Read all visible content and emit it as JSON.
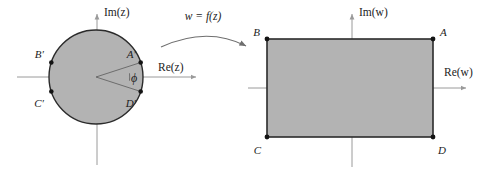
{
  "figure": {
    "background_color": "#ffffff",
    "ink_color": "#1c1c1c",
    "fill_color": "#b3b3b3",
    "axis_color": "#9a9a9a",
    "outline_color": "#2b2b2b"
  },
  "mapping": {
    "label": "w = f(z)",
    "arrow_name": "curved-arrow"
  },
  "z_plane": {
    "axis_imaginary_label": "Im(z)",
    "axis_real_label": "Re(z)",
    "shape": "circle",
    "center": [
      96,
      77
    ],
    "radius": 47,
    "angle_label": "ϕ",
    "points": [
      {
        "id": "A-prime",
        "label": "A′",
        "angle_deg": 18,
        "x": 140.7,
        "y": 62.5,
        "label_x": 136,
        "label_y": 58
      },
      {
        "id": "B-prime",
        "label": "B′",
        "angle_deg": 162,
        "x": 51.3,
        "y": 62.5,
        "label_x": 40,
        "label_y": 58
      },
      {
        "id": "C-prime",
        "label": "C′",
        "angle_deg": 198,
        "x": 51.3,
        "y": 91.5,
        "label_x": 40,
        "label_y": 104
      },
      {
        "id": "D-prime",
        "label": "D′",
        "angle_deg": 342,
        "x": 140.7,
        "y": 91.5,
        "label_x": 136,
        "label_y": 104
      }
    ]
  },
  "w_plane": {
    "axis_imaginary_label": "Im(w)",
    "axis_real_label": "Re(w)",
    "shape": "rectangle",
    "rect": {
      "left": 267,
      "top": 39,
      "right": 433,
      "bottom": 137
    },
    "points": [
      {
        "id": "A",
        "label": "A",
        "x": 433,
        "y": 39,
        "label_x": 440,
        "label_y": 36
      },
      {
        "id": "B",
        "label": "B",
        "x": 267,
        "y": 39,
        "label_x": 254,
        "label_y": 36
      },
      {
        "id": "C",
        "label": "C",
        "x": 267,
        "y": 137,
        "label_x": 254,
        "label_y": 152
      },
      {
        "id": "D",
        "label": "D",
        "x": 433,
        "y": 137,
        "label_x": 440,
        "label_y": 152
      }
    ]
  }
}
